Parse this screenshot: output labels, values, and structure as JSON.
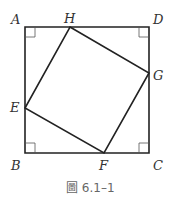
{
  "figure": {
    "caption": "圖 6.1–1",
    "caption_prefix": "圖",
    "caption_number": "6.1–1",
    "stroke_color": "#222222",
    "points": {
      "A": {
        "label": "A",
        "x": 25,
        "y": 27
      },
      "D": {
        "label": "D",
        "x": 149,
        "y": 27
      },
      "B": {
        "label": "B",
        "x": 25,
        "y": 153
      },
      "C": {
        "label": "C",
        "x": 149,
        "y": 153
      },
      "H": {
        "label": "H",
        "x": 70,
        "y": 27
      },
      "G": {
        "label": "G",
        "x": 149,
        "y": 73
      },
      "E": {
        "label": "E",
        "x": 25,
        "y": 108
      },
      "F": {
        "label": "F",
        "x": 104,
        "y": 153
      }
    },
    "outer_square": [
      "A",
      "D",
      "C",
      "B"
    ],
    "inner_square": [
      "H",
      "G",
      "F",
      "E"
    ],
    "right_angle_marks": [
      "A",
      "D",
      "C",
      "B"
    ]
  }
}
